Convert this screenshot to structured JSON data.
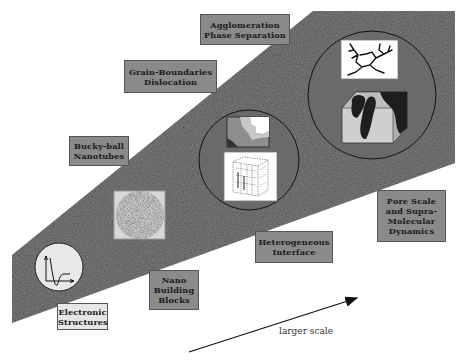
{
  "diagram": {
    "type": "multiscale-progression",
    "colors": {
      "band": "#4a4a4a",
      "circle_fill": "#6b6b6b",
      "label_box_dark": "#8a8a8a",
      "label_box_light": "#e6e6e6",
      "arrow": "#111111"
    },
    "labels": {
      "agglomeration": [
        "Agglomeration",
        "Phase Separation"
      ],
      "grain": [
        "Grain-Boundaries",
        "Dislocation"
      ],
      "bucky": [
        "Bucky-ball",
        "Nanotubes"
      ],
      "electronic": [
        "Electronic",
        "Structures"
      ],
      "nano": [
        "Nano",
        "Building",
        "Blocks"
      ],
      "hetero": [
        "Heterogeneous",
        "Interface"
      ],
      "pore": [
        "Pore Scale",
        "and Supra-",
        "Molecular",
        "Dynamics"
      ]
    },
    "arrow_label": "larger scale",
    "icons": {
      "electronic": "potential-curve-icon",
      "nano": "textured-sphere-icon",
      "hetero_top": "grain-boundary-map-icon",
      "hetero_bottom": "lattice-cube-icon",
      "pore_top": "dendrite-cluster-icon",
      "pore_bottom": "porous-cube-icon"
    }
  }
}
